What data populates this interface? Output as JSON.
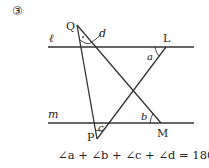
{
  "problem_number": "③",
  "lines": {
    "l": {
      "label": "ℓ"
    },
    "m": {
      "label": "m"
    }
  },
  "points": {
    "Q": "Q",
    "L": "L",
    "M": "M",
    "P": "P"
  },
  "angles": {
    "a": "a",
    "b": "b",
    "c": "c",
    "d": "d"
  },
  "equation": "∠a + ∠b + ∠c + ∠d = 180°",
  "colors": {
    "stroke": "#333333",
    "text": "#222222",
    "background": "#ffffff"
  }
}
